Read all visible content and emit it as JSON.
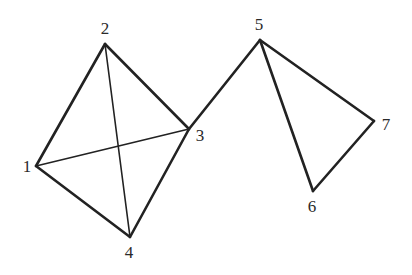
{
  "graph": {
    "nodes": [
      {
        "id": "1",
        "label": "1",
        "x": 36,
        "y": 166,
        "lx": 27,
        "ly": 172
      },
      {
        "id": "2",
        "label": "2",
        "x": 105,
        "y": 44,
        "lx": 105,
        "ly": 34
      },
      {
        "id": "3",
        "label": "3",
        "x": 189,
        "y": 129,
        "lx": 200,
        "ly": 141
      },
      {
        "id": "4",
        "label": "4",
        "x": 130,
        "y": 237,
        "lx": 129,
        "ly": 258
      },
      {
        "id": "5",
        "label": "5",
        "x": 260,
        "y": 40,
        "lx": 259,
        "ly": 30
      },
      {
        "id": "6",
        "label": "6",
        "x": 313,
        "y": 191,
        "lx": 312,
        "ly": 212
      },
      {
        "id": "7",
        "label": "7",
        "x": 374,
        "y": 121,
        "lx": 386,
        "ly": 130
      }
    ],
    "edges": [
      {
        "from": "1",
        "to": "2",
        "weight": "bold"
      },
      {
        "from": "2",
        "to": "3",
        "weight": "bold"
      },
      {
        "from": "3",
        "to": "4",
        "weight": "bold"
      },
      {
        "from": "4",
        "to": "1",
        "weight": "bold"
      },
      {
        "from": "1",
        "to": "3",
        "weight": "thin"
      },
      {
        "from": "2",
        "to": "4",
        "weight": "thin"
      },
      {
        "from": "3",
        "to": "5",
        "weight": "bold"
      },
      {
        "from": "5",
        "to": "6",
        "weight": "bold"
      },
      {
        "from": "6",
        "to": "7",
        "weight": "bold"
      },
      {
        "from": "5",
        "to": "7",
        "weight": "bold"
      }
    ],
    "edge_color": "#222222",
    "background": "#ffffff"
  }
}
